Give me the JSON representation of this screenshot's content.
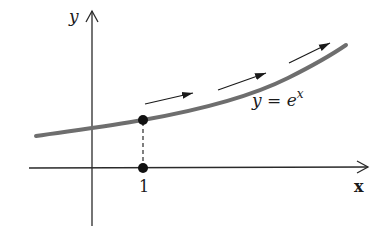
{
  "diagram": {
    "title": "",
    "axes": {
      "x_label": "x",
      "y_label": "y"
    },
    "curve": {
      "label_lhs": "y = e",
      "label_exponent": "x",
      "color": "#6e6e6e"
    },
    "marked_point": {
      "x_tick_label": "1",
      "description": "point (1, e) on curve with dashed drop line to x-axis"
    },
    "flow_arrows": {
      "count": 3,
      "direction": "along curve, increasing x"
    }
  }
}
